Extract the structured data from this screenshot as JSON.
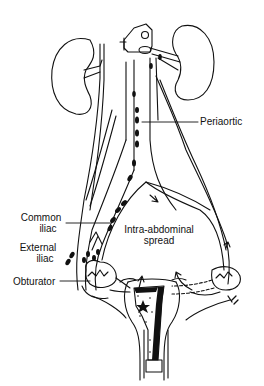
{
  "diagram": {
    "colors": {
      "ink": "#111111",
      "background": "#ffffff"
    },
    "labels": {
      "periaortic": "Periaortic",
      "common_iliac_1": "Common",
      "common_iliac_2": "iliac",
      "external_iliac_1": "External",
      "external_iliac_2": "iliac",
      "obturator": "Obturator",
      "intra_abdominal_1": "Intra-abdominal",
      "intra_abdominal_2": "spread"
    },
    "structures": [
      "left-kidney",
      "right-kidney",
      "vertebra",
      "aorta",
      "vena-cava",
      "ureters",
      "iliac-vessels",
      "lymph-nodes",
      "peritoneal-cavity",
      "uterus",
      "fallopian-tubes",
      "ovaries",
      "cervix",
      "tumor"
    ]
  }
}
